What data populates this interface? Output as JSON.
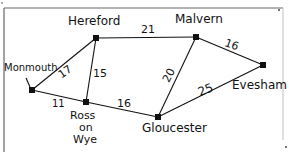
{
  "diagram": {
    "type": "weighted-graph",
    "nodes": [
      {
        "id": "hereford",
        "label": "Hereford",
        "x": 96,
        "y": 38
      },
      {
        "id": "malvern",
        "label": "Malvern",
        "x": 196,
        "y": 37
      },
      {
        "id": "evesham",
        "label": "Evesham",
        "x": 263,
        "y": 65
      },
      {
        "id": "monmouth",
        "label": "Monmouth",
        "x": 32,
        "y": 90
      },
      {
        "id": "ross",
        "label": "Ross on Wye",
        "label_lines": [
          "Ross",
          "on",
          "Wye"
        ],
        "x": 86,
        "y": 102
      },
      {
        "id": "gloucester",
        "label": "Gloucester",
        "x": 158,
        "y": 117
      }
    ],
    "edges": [
      {
        "from": "hereford",
        "to": "malvern",
        "weight": "21"
      },
      {
        "from": "malvern",
        "to": "evesham",
        "weight": "16"
      },
      {
        "from": "hereford",
        "to": "monmouth",
        "weight": "17"
      },
      {
        "from": "hereford",
        "to": "ross",
        "weight": "15"
      },
      {
        "from": "monmouth",
        "to": "ross",
        "weight": "11"
      },
      {
        "from": "ross",
        "to": "gloucester",
        "weight": "16"
      },
      {
        "from": "malvern",
        "to": "gloucester",
        "weight": "20"
      },
      {
        "from": "evesham",
        "to": "gloucester",
        "weight": "25"
      }
    ]
  },
  "labels": {
    "hereford": "Hereford",
    "malvern": "Malvern",
    "evesham": "Evesham",
    "monmouth": "Monmouth",
    "ross_1": "Ross",
    "ross_2": "on",
    "ross_3": "Wye",
    "gloucester": "Gloucester"
  },
  "weights": {
    "hereford_malvern": "21",
    "malvern_evesham": "16",
    "hereford_monmouth": "17",
    "hereford_ross": "15",
    "monmouth_ross": "11",
    "ross_gloucester": "16",
    "malvern_gloucester": "20",
    "evesham_gloucester": "25"
  },
  "colors": {
    "ink": "#111111",
    "frame": "#555555"
  }
}
